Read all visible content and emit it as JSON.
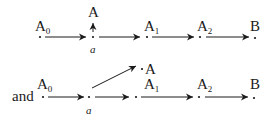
{
  "diagram": {
    "row1": {
      "nodes": [
        {
          "label": "A",
          "sub": "0"
        },
        {
          "label": "a"
        },
        {
          "label": "A",
          "sub": "1"
        },
        {
          "label": "A",
          "sub": "2"
        },
        {
          "label": "B"
        }
      ],
      "branch_label": "A"
    },
    "row2": {
      "prefix": "and",
      "nodes": [
        {
          "label": "A",
          "sub": "0"
        },
        {
          "label": "a"
        },
        {
          "label": "A",
          "sub": "1"
        },
        {
          "label": "A",
          "sub": "2"
        },
        {
          "label": "B"
        }
      ],
      "branch_label": "A"
    }
  }
}
